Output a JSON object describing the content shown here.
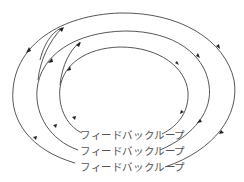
{
  "diagram": {
    "type": "nested feedback loops",
    "loops": [
      {
        "id": "inner",
        "label": "フィードバックループ"
      },
      {
        "id": "middle",
        "label": "フィードバックループ"
      },
      {
        "id": "outer",
        "label": "フィードバックループ"
      }
    ],
    "direction": "clockwise",
    "colors": {
      "stroke": "#444444",
      "text": "#555555",
      "background": "#ffffff"
    }
  }
}
